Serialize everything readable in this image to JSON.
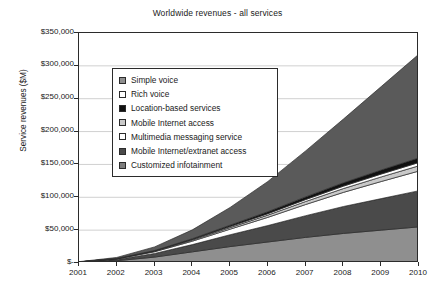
{
  "chart_data": {
    "type": "area",
    "title": "Worldwide revenues - all services",
    "xlabel": "",
    "ylabel": "Service revenues ($M)",
    "stacked": true,
    "grid": true,
    "legend_position": "inside-upper-left",
    "x": [
      2001,
      2002,
      2003,
      2004,
      2005,
      2006,
      2007,
      2008,
      2009,
      2010
    ],
    "categories": [
      "2001",
      "2002",
      "2003",
      "2004",
      "2005",
      "2006",
      "2007",
      "2008",
      "2009",
      "2010"
    ],
    "xlim": [
      2001,
      2010
    ],
    "ylim": [
      0,
      350000
    ],
    "yticks": [
      0,
      50000,
      100000,
      150000,
      200000,
      250000,
      300000,
      350000
    ],
    "ytick_labels": [
      "$-",
      "$50,000",
      "$100,000",
      "$150,000",
      "$200,000",
      "$250,000",
      "$300,000",
      "$350,000"
    ],
    "series": [
      {
        "name": "Simple voice",
        "color": "#8f8f8f",
        "values": [
          900,
          3500,
          9000,
          17000,
          25000,
          32000,
          39000,
          45000,
          50000,
          55000
        ]
      },
      {
        "name": "Rich voice",
        "color": "#4a4a4a",
        "values": [
          400,
          1800,
          5500,
          11000,
          18000,
          25000,
          33000,
          41000,
          48000,
          55000
        ]
      },
      {
        "name": "Location-based services",
        "color": "#ffffff",
        "values": [
          200,
          900,
          2600,
          5200,
          8500,
          12500,
          17000,
          21500,
          26000,
          30000
        ]
      },
      {
        "name": "Mobile Internet access",
        "color": "#c9c9c9",
        "values": [
          60,
          260,
          750,
          1500,
          2400,
          3400,
          4600,
          5800,
          7000,
          8000
        ]
      },
      {
        "name": "Multimedia messaging service",
        "color": "#ffffff",
        "values": [
          40,
          170,
          480,
          950,
          1550,
          2200,
          2950,
          3700,
          4400,
          5000
        ]
      },
      {
        "name": "Mobile Internet/extranet access",
        "color": "#111111",
        "values": [
          50,
          220,
          640,
          1300,
          2100,
          3000,
          4050,
          5100,
          6100,
          7000
        ]
      },
      {
        "name": "Customized infotainment",
        "color": "#5a5a5a",
        "values": [
          350,
          1600,
          5500,
          13500,
          27000,
          46000,
          70000,
          97000,
          127000,
          158000
        ]
      }
    ],
    "totals": [
      2000,
      8450,
      24470,
      50450,
      84550,
      124100,
      170600,
      219100,
      268500,
      318000
    ]
  },
  "legend": {
    "items": [
      {
        "label": "Simple voice",
        "swatch": "#8f8f8f"
      },
      {
        "label": "Rich voice",
        "swatch": "#ffffff"
      },
      {
        "label": "Location-based services",
        "swatch": "#111111"
      },
      {
        "label": "Mobile Internet access",
        "swatch": "#c9c9c9"
      },
      {
        "label": "Multimedia messaging service",
        "swatch": "#ffffff"
      },
      {
        "label": "Mobile Internet/extranet access",
        "swatch": "#4a4a4a"
      },
      {
        "label": "Customized infotainment",
        "swatch": "#7d7d7d"
      }
    ]
  },
  "axes": {
    "y_title": "Service revenues ($M)",
    "y_tick_labels": [
      "$350,000",
      "$300,000",
      "$250,000",
      "$200,000",
      "$150,000",
      "$100,000",
      "$50,000",
      "$-"
    ],
    "x_tick_labels": [
      "2001",
      "2002",
      "2003",
      "2004",
      "2005",
      "2006",
      "2007",
      "2008",
      "2009",
      "2010"
    ]
  },
  "colors": {
    "axis": "#2b2b2b",
    "grid": "#d0d0d0",
    "background": "#ffffff",
    "text": "#1a1a1a"
  }
}
